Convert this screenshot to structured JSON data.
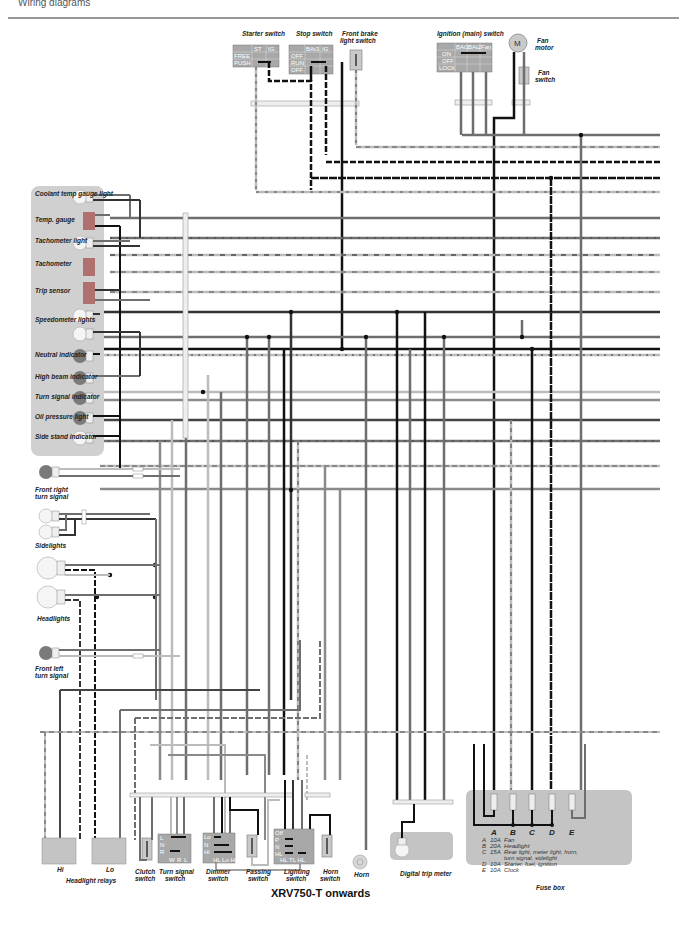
{
  "header": {
    "text": "Wiring diagrams"
  },
  "title": "XRV750-T onwards",
  "colors": {
    "panel": "#d0d0d0",
    "panel_dark": "#a8a8a8",
    "wire_black": "#1a1a1a",
    "wire_grey": "#6e6e6e",
    "wire_light": "#bcbcbc",
    "component_red": "#b07070"
  },
  "switches": {
    "starter": {
      "label": "Starter switch",
      "cols": [
        "ST",
        "IG"
      ],
      "rows": [
        "FREE",
        "PUSH"
      ]
    },
    "stop": {
      "label": "Stop switch",
      "cols": [
        "BAt3",
        "IG"
      ],
      "rows": [
        "OFF",
        "RUN",
        "OFF"
      ]
    },
    "front_brake": {
      "label": "Front brake light switch"
    },
    "ignition": {
      "label": "Ignition (main) switch",
      "cols": [
        "BAt1",
        "BAt2",
        "Fan"
      ],
      "rows": [
        "ON",
        "OFF",
        "LOCK"
      ]
    },
    "fan_motor": {
      "label": "Fan motor",
      "symbol": "M"
    },
    "fan_switch": {
      "label": "Fan switch"
    }
  },
  "instrument_panel": {
    "items": [
      "Coolant temp gauge light",
      "Temp. gauge",
      "Tachometer light",
      "Tachometer",
      "Trip sensor",
      "Speedometer lights",
      "Neutral indicator",
      "High beam indicator",
      "Turn signal indicator",
      "Oil pressure light",
      "Side stand indicator"
    ]
  },
  "front_lights": {
    "front_right": "Front right turn signal",
    "sidelights": "Sidelights",
    "headlights": "Headlights",
    "front_left": "Front left turn signal"
  },
  "bottom_components": {
    "relay_hi": "Hi",
    "relay_lo": "Lo",
    "relays_label": "Headlight relays",
    "clutch": "Clutch switch",
    "turn_signal": {
      "label": "Turn signal switch",
      "rows": [
        "L",
        "N",
        "R"
      ],
      "cols": [
        "W",
        "R",
        "L"
      ]
    },
    "dimmer": {
      "label": "Dimmer switch",
      "rows": [
        "Lo",
        "N",
        "Hi"
      ],
      "cols": "HL Lo Hi"
    },
    "passing": "Passing switch",
    "lighting": {
      "label": "Lighting switch",
      "rows": [
        "Off",
        "P",
        "N",
        "HL"
      ],
      "cols": "HL TL HL"
    },
    "horn_switch": "Horn switch",
    "horn": "Horn",
    "trip_meter": "Digital trip meter"
  },
  "fuse_box": {
    "label": "Fuse box",
    "letters": [
      "A",
      "B",
      "C",
      "D",
      "E"
    ],
    "legend": [
      {
        "id": "A",
        "rating": "10A",
        "desc": "Fan"
      },
      {
        "id": "B",
        "rating": "20A",
        "desc": "Headlight"
      },
      {
        "id": "C",
        "rating": "15A",
        "desc": "Rear light, meter light, horn,"
      },
      {
        "id": "",
        "rating": "",
        "desc": "turn signal, sidelight"
      },
      {
        "id": "D",
        "rating": "10A",
        "desc": "Starter, fuel, ignition"
      },
      {
        "id": "E",
        "rating": "10A",
        "desc": "Clock"
      }
    ]
  }
}
